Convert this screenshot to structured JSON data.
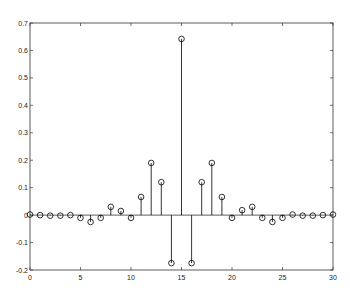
{
  "chart_data": {
    "type": "stem",
    "title": "",
    "xlabel": "",
    "ylabel": "",
    "xlim": [
      0,
      30
    ],
    "ylim": [
      -0.2,
      0.7
    ],
    "grid": false,
    "legend": null,
    "x_ticks": [
      0,
      5,
      10,
      15,
      20,
      25,
      30
    ],
    "y_ticks": [
      -0.2,
      -0.1,
      0,
      0.1,
      0.2,
      0.3,
      0.4,
      0.5,
      0.6,
      0.7
    ],
    "x_tick_labels": [
      "0",
      "5",
      "10",
      "15",
      "20",
      "25",
      "30"
    ],
    "y_tick_labels": [
      "-0.2",
      "-0.1",
      "0",
      "0.1",
      "0.2",
      "0.3",
      "0.4",
      "0.5",
      "0.6",
      "0.7"
    ],
    "x": [
      0,
      1,
      2,
      3,
      4,
      5,
      6,
      7,
      8,
      9,
      10,
      11,
      12,
      13,
      14,
      15,
      16,
      17,
      18,
      19,
      20,
      21,
      22,
      23,
      24,
      25,
      26,
      27,
      28,
      29,
      30
    ],
    "values": [
      0.002,
      0.0,
      -0.002,
      -0.002,
      0.0,
      -0.01,
      -0.025,
      -0.01,
      0.03,
      0.015,
      -0.01,
      0.066,
      0.19,
      0.12,
      -0.175,
      0.642,
      -0.175,
      0.12,
      0.19,
      0.066,
      -0.01,
      0.018,
      0.03,
      -0.01,
      -0.025,
      -0.01,
      0.002,
      -0.002,
      -0.002,
      0.0,
      0.002
    ],
    "marker": "open-circle",
    "color": "#000000"
  }
}
